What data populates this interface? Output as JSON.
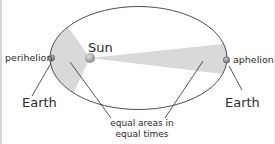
{
  "diagram": {
    "labels": {
      "sun": "Sun",
      "perihelion": "perihelion",
      "aphelion": "aphelion",
      "earth_left": "Earth",
      "earth_right": "Earth",
      "equal_areas_line1": "equal areas in",
      "equal_areas_line2": "equal times"
    },
    "colors": {
      "orbit": "#3a3a3a",
      "swept_area": "#d9d9d9",
      "sun": "#9a9a9a",
      "planet": "#8c8c8c",
      "text": "#2b2b2b"
    }
  }
}
